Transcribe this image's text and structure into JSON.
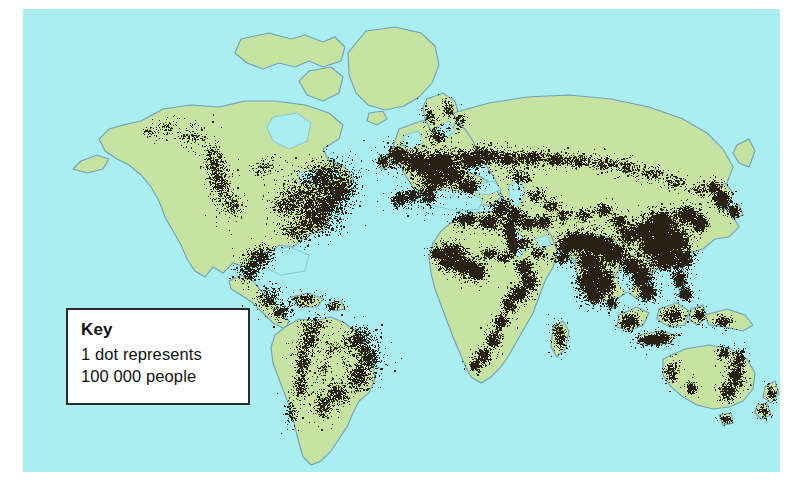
{
  "figure": {
    "kind": "world-population-dot-density-map",
    "title_visible": false
  },
  "colors": {
    "page_background": "#ffffff",
    "ocean": "#aaeef2",
    "land": "#c6e3a2",
    "land_outline": "#6f9fb8",
    "coast_water_line": "#7fbdd4",
    "dot": "#2a2115",
    "key_box_fill": "#ffffff",
    "key_box_border": "#2b2b2b",
    "key_text": "#111111"
  },
  "key": {
    "title": "Key",
    "line1": "1 dot represents",
    "line2": "100 000 people",
    "dot_value": 100000,
    "dot_unit": "people"
  },
  "map": {
    "projection_note": "equirectangular-like world map",
    "plate": {
      "x": 23,
      "y": 9,
      "width": 757,
      "height": 463
    },
    "view_box": "0 0 757 463"
  },
  "chart_data": {
    "type": "scatter",
    "xlabel": "",
    "ylabel": "",
    "legend_position": "bottom-left",
    "grid": false,
    "dot_value": 100000,
    "dot_unit": "people",
    "regions": [
      {
        "name": "North America - US Northeast / Great Lakes",
        "density": "very-high"
      },
      {
        "name": "North America - US South / Gulf",
        "density": "high"
      },
      {
        "name": "North America - US West Coast",
        "density": "high"
      },
      {
        "name": "Mexico / Central America",
        "density": "high"
      },
      {
        "name": "Caribbean",
        "density": "medium"
      },
      {
        "name": "South America - Brazil coast",
        "density": "very-high"
      },
      {
        "name": "South America - Andes / Pacific coast",
        "density": "high"
      },
      {
        "name": "South America - Rio de la Plata",
        "density": "high"
      },
      {
        "name": "South America - Amazon interior",
        "density": "very-low"
      },
      {
        "name": "Europe - Western / Central",
        "density": "very-high"
      },
      {
        "name": "Europe - Mediterranean",
        "density": "high"
      },
      {
        "name": "Europe - British Isles",
        "density": "high"
      },
      {
        "name": "Scandinavia",
        "density": "low"
      },
      {
        "name": "Russia - Trans-Siberian belt",
        "density": "medium"
      },
      {
        "name": "Siberia north",
        "density": "very-low"
      },
      {
        "name": "North Africa - Nile valley / Maghreb",
        "density": "high"
      },
      {
        "name": "Sahara",
        "density": "very-low"
      },
      {
        "name": "West Africa - Gulf of Guinea",
        "density": "very-high"
      },
      {
        "name": "East Africa highlands",
        "density": "high"
      },
      {
        "name": "Southern Africa",
        "density": "medium"
      },
      {
        "name": "Middle East / Mesopotamia",
        "density": "high"
      },
      {
        "name": "South Asia - Indo-Gangetic plain",
        "density": "very-high"
      },
      {
        "name": "South Asia - India peninsula",
        "density": "very-high"
      },
      {
        "name": "Southeast Asia - Indochina",
        "density": "very-high"
      },
      {
        "name": "Indonesia - Java",
        "density": "very-high"
      },
      {
        "name": "East Asia - Eastern China",
        "density": "very-high"
      },
      {
        "name": "East Asia - Japan / Korea",
        "density": "very-high"
      },
      {
        "name": "Central Asia deserts / Tibet",
        "density": "very-low"
      },
      {
        "name": "Australia - East / Southeast coast",
        "density": "medium"
      },
      {
        "name": "Australia - interior",
        "density": "very-low"
      },
      {
        "name": "New Zealand",
        "density": "medium"
      },
      {
        "name": "Greenland",
        "density": "none"
      },
      {
        "name": "Canadian Arctic",
        "density": "none"
      }
    ]
  }
}
